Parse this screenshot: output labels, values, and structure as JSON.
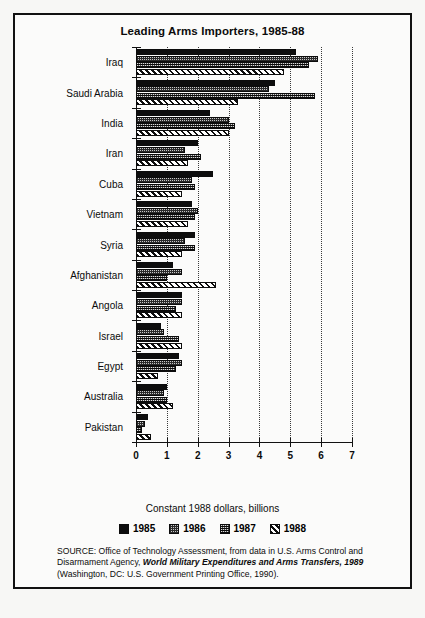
{
  "figure": {
    "title": "Leading Arms Importers, 1985-88",
    "x_caption": "Constant 1988 dollars, billions",
    "source": {
      "prefix": "SOURCE:",
      "line1": "Office of Technology Assessment, from data in U.S. Arms",
      "line2_plain": "Control and Disarmament Agency,",
      "line2_italic": "World Military Expenditures",
      "line3_italic": "and Arms Transfers, 1989",
      "line3_plain": "(Washington, DC: U.S. Government",
      "line4": "Printing Office, 1990)."
    }
  },
  "legend": {
    "position": "bottom-center",
    "items": [
      {
        "label": "1985",
        "pattern": "solid-black"
      },
      {
        "label": "1986",
        "pattern": "light-stipple"
      },
      {
        "label": "1987",
        "pattern": "dark-checker"
      },
      {
        "label": "1988",
        "pattern": "diagonal-hatch"
      }
    ]
  },
  "chart_data": {
    "type": "bar",
    "orientation": "horizontal",
    "title": "Leading Arms Importers, 1985-88",
    "xlabel": "Constant 1988 dollars, billions",
    "ylabel": "",
    "xlim": [
      0,
      7
    ],
    "xticks": [
      0,
      1,
      2,
      3,
      4,
      5,
      6,
      7
    ],
    "xtick_labels": [
      "0",
      "1",
      "2",
      "3",
      "4",
      "5",
      "6",
      "7"
    ],
    "grid": "vertical-dotted",
    "categories": [
      "Iraq",
      "Saudi Arabia",
      "India",
      "Iran",
      "Cuba",
      "Vietnam",
      "Syria",
      "Afghanistan",
      "Angola",
      "Israel",
      "Egypt",
      "Australia",
      "Pakistan"
    ],
    "series": [
      {
        "name": "1985",
        "values": [
          5.2,
          4.5,
          2.4,
          2.0,
          2.5,
          1.8,
          1.9,
          1.2,
          1.5,
          0.8,
          1.4,
          1.0,
          0.4
        ]
      },
      {
        "name": "1986",
        "values": [
          5.9,
          4.3,
          3.0,
          1.6,
          1.8,
          2.0,
          1.6,
          1.5,
          1.5,
          0.9,
          1.5,
          0.9,
          0.3
        ]
      },
      {
        "name": "1987",
        "values": [
          5.6,
          5.8,
          3.2,
          2.1,
          1.9,
          1.9,
          1.9,
          1.0,
          1.3,
          1.4,
          1.3,
          1.0,
          0.2
        ]
      },
      {
        "name": "1988",
        "values": [
          4.8,
          3.3,
          3.0,
          1.7,
          1.5,
          1.7,
          1.5,
          2.6,
          1.5,
          1.5,
          0.7,
          1.2,
          0.5
        ]
      }
    ]
  }
}
